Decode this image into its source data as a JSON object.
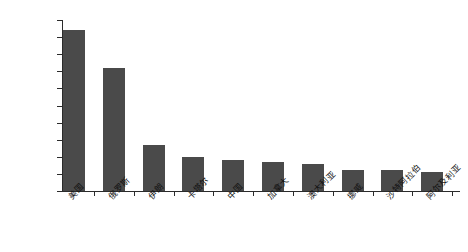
{
  "chart_data": {
    "type": "bar",
    "title": "",
    "xlabel": "",
    "ylabel": "产量（亿立方米）",
    "ylim": [
      0,
      10000
    ],
    "ytick_step": 1000,
    "grid": false,
    "legend": null,
    "bar_color": "#4a4a4a",
    "axis_color": "#2b2b2b",
    "categories": [
      "美国",
      "俄罗斯",
      "伊朗",
      "卡塔尔",
      "中国",
      "加拿大",
      "澳大利亚",
      "挪威",
      "沙特阿拉伯",
      "阿尔及利亚"
    ],
    "values": [
      9400,
      7200,
      2700,
      2000,
      1800,
      1700,
      1580,
      1230,
      1200,
      1130
    ],
    "ytick_labels": [
      "0",
      "1000",
      "2000",
      "3000",
      "4000",
      "5000",
      "6000",
      "7000",
      "8000",
      "9000",
      "10000"
    ]
  }
}
